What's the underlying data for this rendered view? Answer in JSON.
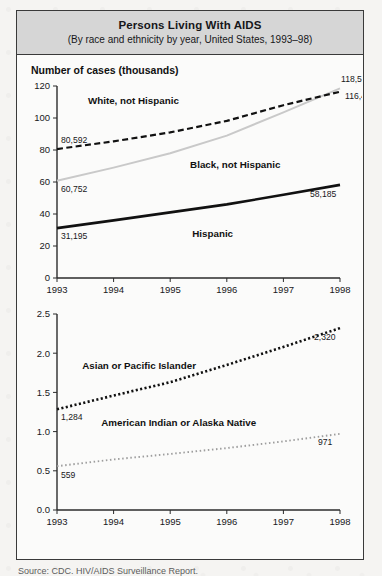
{
  "figure": {
    "title": "Persons Living With AIDS",
    "subtitle": "(By race and ethnicity by year, United States, 1993–98)",
    "source": "Source: CDC. HIV/AIDS Surveillance Report."
  },
  "chart_data": [
    {
      "type": "line",
      "title": "Persons Living With AIDS",
      "subtitle": "(By race and ethnicity by year, United States, 1993–98)",
      "ylabel": "Number of cases (thousands)",
      "xlabel": "",
      "x": [
        1993,
        1994,
        1995,
        1996,
        1997,
        1998
      ],
      "xtick_labels": [
        "1993",
        "1994",
        "1995",
        "1996",
        "1997",
        "1998"
      ],
      "ytick_labels": [
        "0",
        "20",
        "40",
        "60",
        "80",
        "100",
        "120"
      ],
      "yticks": [
        0,
        20,
        40,
        60,
        80,
        100,
        120
      ],
      "ylim": [
        0,
        120
      ],
      "grid": false,
      "legend_position": "inline-annotations",
      "series": [
        {
          "name": "White, not Hispanic",
          "style": "dashed",
          "color": "#111111",
          "values": [
            80.592,
            85.4,
            91.0,
            98.2,
            108.0,
            116.445
          ],
          "start_label": "80,592",
          "end_label": "116,445"
        },
        {
          "name": "Black, not Hispanic",
          "style": "solid-light",
          "color": "#c9c9c9",
          "values": [
            60.752,
            69.0,
            78.0,
            89.0,
            103.5,
            118.525
          ],
          "start_label": "60,752",
          "end_label": "118,525"
        },
        {
          "name": "Hispanic",
          "style": "solid-bold",
          "color": "#111111",
          "values": [
            31.195,
            36.0,
            41.0,
            46.0,
            52.0,
            58.185
          ],
          "start_label": "31,195",
          "end_label": "58,185"
        }
      ]
    },
    {
      "type": "line",
      "title": "",
      "ylabel": "",
      "xlabel": "",
      "x": [
        1993,
        1994,
        1995,
        1996,
        1997,
        1998
      ],
      "xtick_labels": [
        "1993",
        "1994",
        "1995",
        "1996",
        "1997",
        "1998"
      ],
      "ytick_labels": [
        "0.0",
        "0.5",
        "1.0",
        "1.5",
        "2.0",
        "2.5"
      ],
      "yticks": [
        0.0,
        0.5,
        1.0,
        1.5,
        2.0,
        2.5
      ],
      "ylim": [
        0.0,
        2.5
      ],
      "grid": false,
      "legend_position": "inline-annotations",
      "series": [
        {
          "name": "Asian or Pacific Islander",
          "style": "dotted-bold",
          "color": "#111111",
          "values": [
            1.284,
            1.46,
            1.63,
            1.85,
            2.08,
            2.32
          ],
          "start_label": "1,284",
          "end_label": "2,320"
        },
        {
          "name": "American Indian or Alaska Native",
          "style": "dotted-fine",
          "color": "#9d9d9d",
          "values": [
            0.559,
            0.645,
            0.715,
            0.79,
            0.875,
            0.971
          ],
          "start_label": "559",
          "end_label": "971"
        }
      ]
    }
  ]
}
